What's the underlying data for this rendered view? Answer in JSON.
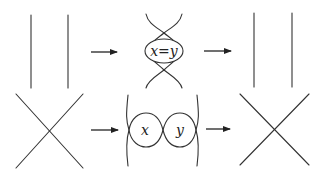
{
  "diagram": {
    "type": "skein-relation-rewriting",
    "colors": {
      "stroke": "#333333",
      "background": "#ffffff"
    },
    "rows": [
      {
        "name": "parallel-strands-row",
        "stages": [
          {
            "name": "two-vertical-strands"
          },
          {
            "name": "arrow",
            "direction": "right"
          },
          {
            "name": "double-twist-with-box",
            "box_label": "x=y"
          },
          {
            "name": "arrow",
            "direction": "right"
          },
          {
            "name": "two-vertical-strands"
          }
        ]
      },
      {
        "name": "crossing-row",
        "stages": [
          {
            "name": "crossing-x"
          },
          {
            "name": "arrow",
            "direction": "right"
          },
          {
            "name": "two-loops-between-strands",
            "left_loop_label": "x",
            "right_loop_label": "y"
          },
          {
            "name": "arrow",
            "direction": "right"
          },
          {
            "name": "crossing-x"
          }
        ]
      }
    ],
    "labels": {
      "top_box": "x=y",
      "bottom_left_loop": "x",
      "bottom_right_loop": "y"
    }
  }
}
